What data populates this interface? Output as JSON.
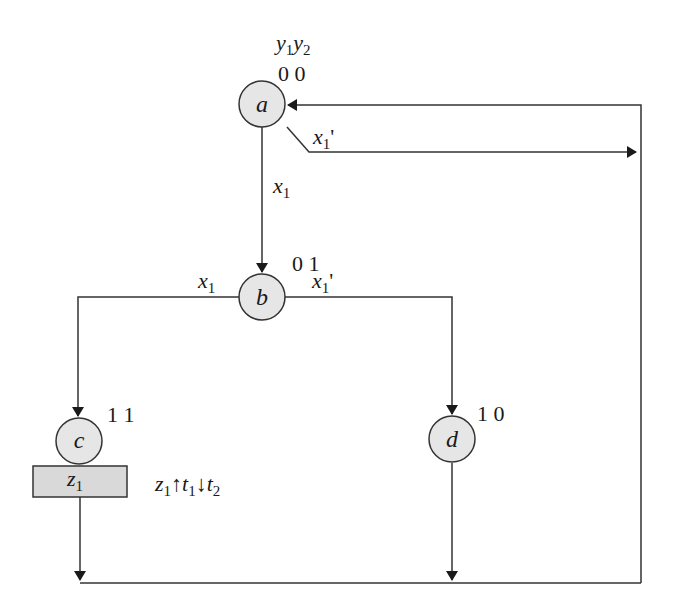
{
  "diagram": {
    "header": {
      "var1": "y",
      "var1_sub": "1",
      "var2": "y",
      "var2_sub": "2"
    },
    "states": [
      {
        "name": "a",
        "code": "0 0"
      },
      {
        "name": "b",
        "code": "0 1"
      },
      {
        "name": "c",
        "code": "1 1",
        "output": {
          "var": "z",
          "sub": "1"
        }
      },
      {
        "name": "d",
        "code": "1 0"
      }
    ],
    "transitions": [
      {
        "from": "a",
        "to": "b",
        "condition": {
          "var": "x",
          "sub": "1",
          "prime": ""
        }
      },
      {
        "from": "a",
        "to": "a",
        "condition": {
          "var": "x",
          "sub": "1",
          "prime": "'"
        }
      },
      {
        "from": "b",
        "to": "c",
        "condition": {
          "var": "x",
          "sub": "1",
          "prime": ""
        }
      },
      {
        "from": "b",
        "to": "d",
        "condition": {
          "var": "x",
          "sub": "1",
          "prime": "'"
        }
      },
      {
        "from": "c",
        "to": "a",
        "condition": null
      },
      {
        "from": "d",
        "to": "a",
        "condition": null
      }
    ],
    "action_note": {
      "z": "z",
      "z_sub": "1",
      "up_arrow": "↑",
      "t1": "t",
      "t1_sub": "1",
      "down_arrow": "↓",
      "t2": "t",
      "t2_sub": "2"
    },
    "colors": {
      "node_fill": "#e6e6e6",
      "stroke": "#333333",
      "box_fill": "#d9d9d9"
    }
  }
}
